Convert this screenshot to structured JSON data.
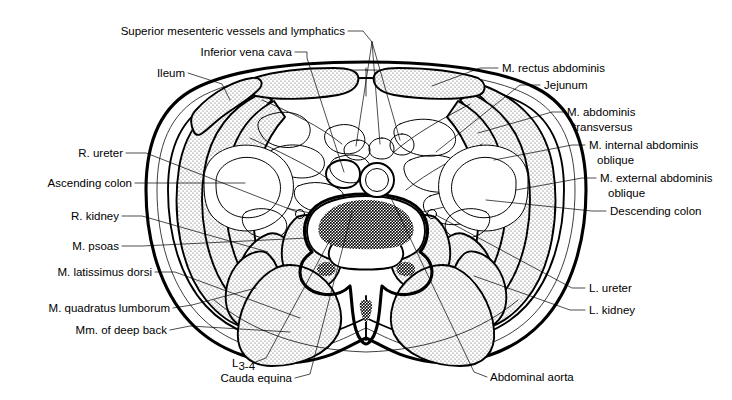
{
  "figure": {
    "background_color": "#ffffff",
    "ink_color": "#000000",
    "stipple_fill": "dotted-gray"
  },
  "labels": {
    "superior_mesenteric": "Superior mesenteric vessels and lymphatics",
    "inferior_vena_cava": "Inferior vena cava",
    "ileum": "Ileum",
    "rectus_abdominis": "M. rectus abdominis",
    "jejunum": "Jejunum",
    "abdominis_transversus_l1": "M. abdominis",
    "abdominis_transversus_l2": "transversus",
    "internal_oblique_l1": "M. internal abdominis",
    "internal_oblique_l2": "oblique",
    "external_oblique_l1": "M. external abdominis",
    "external_oblique_l2": "oblique",
    "descending_colon": "Descending colon",
    "r_ureter": "R. ureter",
    "ascending_colon": "Ascending colon",
    "r_kidney": "R. kidney",
    "psoas": "M. psoas",
    "latissimus_dorsi": "M. latissimus dorsi",
    "quadratus_lumborum": "M. quadratus lumborum",
    "deep_back": "Mm. of deep back",
    "vertebra_base": "L",
    "vertebra_sub": "3-4",
    "cauda_equina": "Cauda equina",
    "abdominal_aorta": "Abdominal aorta",
    "l_ureter": "L. ureter",
    "l_kidney": "L. kidney"
  }
}
